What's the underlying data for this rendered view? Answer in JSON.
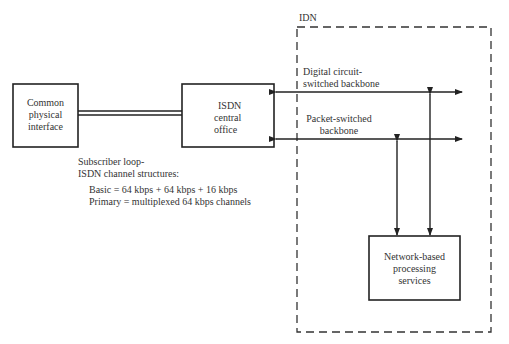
{
  "idn": {
    "label": "IDN"
  },
  "boxes": {
    "common_interface": {
      "lines": [
        "Common",
        "physical",
        "interface"
      ]
    },
    "isdn_office": {
      "lines": [
        "ISDN",
        "central",
        "office"
      ]
    },
    "network_services": {
      "lines": [
        "Network-based",
        "processing",
        "services"
      ]
    }
  },
  "backbones": {
    "circuit": {
      "lines": [
        "Digital circuit-",
        "switched backbone"
      ]
    },
    "packet": {
      "lines": [
        "Packet-switched",
        "backbone"
      ]
    }
  },
  "subscriber_loop": {
    "title_lines": [
      "Subscriber loop-",
      "ISDN channel structures:"
    ],
    "basic": "Basic = 64 kbps + 64 kbps + 16 kbps",
    "primary": "Primary = multiplexed 64 kbps channels"
  }
}
